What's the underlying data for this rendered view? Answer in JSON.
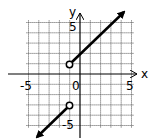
{
  "chart_data": {
    "type": "line",
    "title": "",
    "xlabel": "x",
    "ylabel": "y",
    "xlim": [
      -5,
      5
    ],
    "ylim": [
      -5,
      5
    ],
    "grid": true,
    "tick_labels": {
      "x": [
        "-5",
        "0",
        "5"
      ],
      "y": [
        "5",
        "-5"
      ]
    },
    "series": [
      {
        "name": "upper piece",
        "equation": "y = x + 2",
        "domain": "x > -1",
        "x": [
          -1,
          4.5
        ],
        "y": [
          1,
          6.5
        ],
        "start": "open-circle",
        "end": "arrow"
      },
      {
        "name": "lower piece",
        "equation": "y = x - 2",
        "domain": "x < -1",
        "x": [
          -1,
          -5.3
        ],
        "y": [
          -3,
          -7.3
        ],
        "start": "open-circle",
        "end": "arrow"
      }
    ],
    "open_points": [
      {
        "x": -1,
        "y": 1
      },
      {
        "x": -1,
        "y": -3
      }
    ]
  },
  "labels": {
    "x_axis": "x",
    "y_axis": "y",
    "x_min": "-5",
    "x_max": "5",
    "origin": "0",
    "y_max": "5",
    "y_min": "-5"
  },
  "colors": {
    "line": "#000000",
    "grid": "#555555",
    "background": "#ffffff"
  }
}
